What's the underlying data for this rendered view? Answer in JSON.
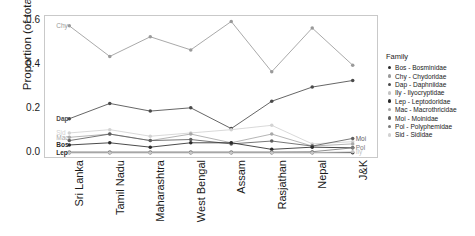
{
  "chart_data": {
    "type": "line",
    "title": "",
    "xlabel": "",
    "ylabel": "Proportion (of total fauna)",
    "ylim": [
      -0.02,
      0.625
    ],
    "yticks": [
      "0.0",
      "0.2",
      "0.4",
      "0.6"
    ],
    "ytick_values": [
      0.0,
      0.2,
      0.4,
      0.6
    ],
    "grid": false,
    "legend_position": "right",
    "legend_title": "Family",
    "categories": [
      "Sri Lanka",
      "Tamil Nadu",
      "Maharashtra",
      "West Bengal",
      "Assam",
      "Rasjathan",
      "Nepal",
      "J&K"
    ],
    "series": [
      {
        "name": "Chy",
        "full_name": "Chydoridae",
        "code": "Chy",
        "color": "#9a9a9a",
        "values": [
          0.58,
          0.44,
          0.53,
          0.47,
          0.6,
          0.37,
          0.57,
          0.4
        ],
        "label_side": "left",
        "label": "Chy"
      },
      {
        "name": "Dap",
        "full_name": "Daphniidae",
        "code": "Dap",
        "color": "#4a4a4a",
        "values": [
          0.155,
          0.225,
          0.19,
          0.205,
          0.11,
          0.235,
          0.3,
          0.33
        ],
        "label_side": "left",
        "label": "Dap"
      },
      {
        "name": "Sid",
        "full_name": "Sididae",
        "code": "Sid",
        "color": "#d2d2d2",
        "values": [
          0.09,
          0.105,
          0.075,
          0.09,
          0.105,
          0.125,
          0.04,
          0.05
        ],
        "label_side": "left",
        "label": "Sid"
      },
      {
        "name": "Mac",
        "full_name": "Macrothricidae",
        "code": "Mac",
        "color": "#a8a8a8",
        "values": [
          0.07,
          0.085,
          0.055,
          0.085,
          0.045,
          0.085,
          0.03,
          0.04
        ],
        "label_side": "left",
        "label": "Mac"
      },
      {
        "name": "Moi",
        "full_name": "Moinidae",
        "code": "Moi",
        "color": "#5f5f5f",
        "values": [
          0.055,
          0.085,
          0.055,
          0.06,
          0.04,
          0.053,
          0.03,
          0.065
        ],
        "label_side": "right",
        "label": "Moi"
      },
      {
        "name": "Bos",
        "full_name": "Bosminidae",
        "code": "Bos",
        "color": "#2b2b2b",
        "values": [
          0.035,
          0.045,
          0.025,
          0.045,
          0.045,
          0.015,
          0.025,
          0.022
        ],
        "label_side": "left",
        "label": "Bos"
      },
      {
        "name": "Pol",
        "full_name": "Polyphemidae",
        "code": "Pol",
        "color": "#7b7b7b",
        "values": [
          0.003,
          0.003,
          0.003,
          0.003,
          0.003,
          0.003,
          0.004,
          0.022
        ],
        "label_side": "right",
        "label": "Pol"
      },
      {
        "name": "Lep",
        "full_name": "Leptodoridae",
        "code": "Lep",
        "color": "#2b2b2b",
        "values": [
          0.0,
          0.0,
          0.0,
          0.0,
          0.0,
          0.0,
          0.0,
          0.0
        ],
        "label_side": "left",
        "label": "Lep"
      },
      {
        "name": "Ily",
        "full_name": "Ilyocryptidae",
        "code": "Ily",
        "color": "#c4c4c4",
        "values": [
          0.0,
          0.0,
          0.0,
          0.0,
          0.0,
          0.0,
          0.0,
          0.004
        ],
        "label_side": "right",
        "label": "Ily"
      }
    ]
  },
  "legend": {
    "title": "Family",
    "items": [
      {
        "code": "Bos",
        "sep": "-",
        "name": "Bosminidae",
        "color": "#2b2b2b"
      },
      {
        "code": "Chy",
        "sep": "-",
        "name": "Chydoridae",
        "color": "#9a9a9a"
      },
      {
        "code": "Dap",
        "sep": "-",
        "name": "Daphniidae",
        "color": "#4a4a4a"
      },
      {
        "code": "Ily",
        "sep": "-",
        "name": "Ilyocryptidae",
        "color": "#c4c4c4"
      },
      {
        "code": "Lep",
        "sep": "-",
        "name": "Leptodoridae",
        "color": "#2b2b2b"
      },
      {
        "code": "Mac",
        "sep": "-",
        "name": "Macrothricidae",
        "color": "#a8a8a8"
      },
      {
        "code": "Moi",
        "sep": "-",
        "name": "Moinidae",
        "color": "#5f5f5f"
      },
      {
        "code": "Pol",
        "sep": "-",
        "name": "Polyphemidae",
        "color": "#7b7b7b"
      },
      {
        "code": "Sid",
        "sep": "-",
        "name": "Sididae",
        "color": "#d2d2d2"
      }
    ]
  },
  "axes": {
    "y_title": "Proportion (of total fauna)",
    "y_ticks": [
      "0.6",
      "0.4",
      "0.2",
      "0.0"
    ],
    "x_ticks": [
      "Sri Lanka",
      "Tamil Nadu",
      "Maharashtra",
      "West Bengal",
      "Assam",
      "Rasjathan",
      "Nepal",
      "J&K"
    ]
  }
}
